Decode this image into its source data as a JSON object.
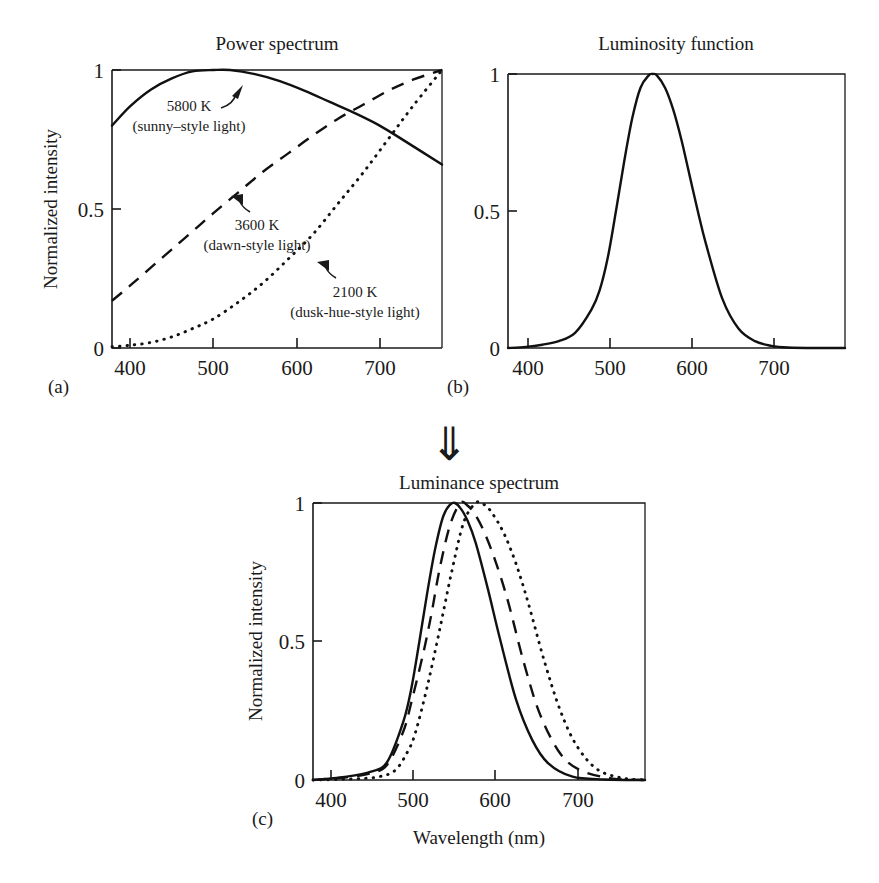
{
  "figure": {
    "panels": [
      {
        "id": "a",
        "label": "(a)",
        "title": "Power spectrum",
        "ylabel": "Normalized intensity",
        "xlabel": "",
        "annotations": [
          {
            "line1": "5800 K",
            "line2": "(sunny–style light)"
          },
          {
            "line1": "3600 K",
            "line2": "(dawn-style light)"
          },
          {
            "line1": "2100 K",
            "line2": "(dusk-hue-style light)"
          }
        ]
      },
      {
        "id": "b",
        "label": "(b)",
        "title": "Luminosity function",
        "ylabel": "",
        "xlabel": ""
      },
      {
        "id": "c",
        "label": "(c)",
        "title": "Luminance spectrum",
        "ylabel": "Normalized intensity",
        "xlabel": "Wavelength (nm)"
      }
    ],
    "flow_arrow": "⇓",
    "xticks": [
      "400",
      "500",
      "600",
      "700"
    ],
    "yticks": [
      "0",
      "0.5",
      "1"
    ]
  },
  "chart_data": [
    {
      "panel": "a",
      "type": "line",
      "title": "Power spectrum",
      "xlabel": "",
      "ylabel": "Normalized intensity",
      "xlim": [
        378,
        775
      ],
      "ylim": [
        0,
        1
      ],
      "xticks": [
        400,
        500,
        600,
        700
      ],
      "yticks": [
        0,
        0.5,
        1
      ],
      "grid": false,
      "legend": "inline annotations",
      "series": [
        {
          "name": "5800 K (sunny–style light)",
          "style": "solid",
          "annotation": "5800 K\n(sunny–style light)",
          "x": [
            378,
            400,
            425,
            450,
            475,
            500,
            520,
            550,
            580,
            610,
            640,
            670,
            700,
            730,
            775
          ],
          "values": [
            0.8,
            0.87,
            0.93,
            0.97,
            0.995,
            1.0,
            1.0,
            0.985,
            0.96,
            0.925,
            0.885,
            0.845,
            0.8,
            0.745,
            0.66
          ]
        },
        {
          "name": "3600 K (dawn-style light)",
          "style": "dashed",
          "annotation": "3600 K\n(dawn-style light)",
          "x": [
            378,
            400,
            425,
            450,
            475,
            500,
            530,
            560,
            590,
            620,
            650,
            680,
            710,
            740,
            775
          ],
          "values": [
            0.17,
            0.225,
            0.29,
            0.355,
            0.42,
            0.485,
            0.56,
            0.635,
            0.7,
            0.765,
            0.825,
            0.875,
            0.925,
            0.965,
            1.0
          ]
        },
        {
          "name": "2100 K (dusk-hue-style light)",
          "style": "dotted",
          "annotation": "2100 K\n(dusk-hue-style light)",
          "x": [
            378,
            400,
            425,
            450,
            475,
            500,
            530,
            560,
            590,
            620,
            650,
            680,
            710,
            740,
            775
          ],
          "values": [
            0.005,
            0.01,
            0.02,
            0.04,
            0.07,
            0.105,
            0.165,
            0.235,
            0.32,
            0.41,
            0.52,
            0.63,
            0.75,
            0.87,
            1.0
          ]
        }
      ]
    },
    {
      "panel": "b",
      "type": "line",
      "title": "Luminosity function",
      "xlabel": "",
      "ylabel": "",
      "xlim": [
        378,
        790
      ],
      "ylim": [
        0,
        1
      ],
      "xticks": [
        400,
        500,
        600,
        700
      ],
      "yticks": [
        0,
        0.5,
        1
      ],
      "grid": false,
      "series": [
        {
          "name": "Luminosity function V(λ)",
          "style": "solid",
          "peak_nm": 555,
          "x": [
            378,
            400,
            420,
            440,
            460,
            480,
            490,
            500,
            510,
            520,
            530,
            540,
            550,
            555,
            560,
            570,
            580,
            590,
            600,
            610,
            620,
            640,
            660,
            680,
            700,
            720,
            760,
            790
          ],
          "values": [
            0.0,
            0.004,
            0.012,
            0.025,
            0.055,
            0.14,
            0.21,
            0.33,
            0.5,
            0.68,
            0.84,
            0.95,
            0.995,
            1.0,
            0.995,
            0.95,
            0.87,
            0.76,
            0.63,
            0.5,
            0.38,
            0.18,
            0.07,
            0.025,
            0.008,
            0.002,
            0.0,
            0.0
          ]
        }
      ]
    },
    {
      "panel": "c",
      "type": "line",
      "title": "Luminance spectrum",
      "xlabel": "Wavelength (nm)",
      "ylabel": "Normalized intensity",
      "xlim": [
        378,
        790
      ],
      "ylim": [
        0,
        1
      ],
      "xticks": [
        400,
        500,
        600,
        700
      ],
      "yticks": [
        0,
        0.5,
        1
      ],
      "grid": false,
      "series": [
        {
          "name": "5800 K luminance",
          "style": "solid",
          "peak_nm": 551,
          "x": [
            378,
            420,
            450,
            470,
            490,
            500,
            510,
            520,
            530,
            540,
            551,
            560,
            570,
            580,
            595,
            610,
            630,
            650,
            670,
            700,
            740,
            790
          ],
          "values": [
            0.0,
            0.012,
            0.03,
            0.065,
            0.21,
            0.33,
            0.5,
            0.68,
            0.84,
            0.955,
            1.0,
            0.985,
            0.935,
            0.855,
            0.69,
            0.51,
            0.29,
            0.145,
            0.06,
            0.012,
            0.002,
            0.0
          ]
        },
        {
          "name": "3600 K luminance",
          "style": "dashed",
          "peak_nm": 561,
          "x": [
            378,
            420,
            450,
            470,
            490,
            500,
            515,
            525,
            535,
            548,
            561,
            570,
            580,
            592,
            605,
            620,
            640,
            660,
            685,
            710,
            750,
            790
          ],
          "values": [
            0.0,
            0.01,
            0.025,
            0.055,
            0.175,
            0.28,
            0.46,
            0.6,
            0.76,
            0.92,
            1.0,
            0.99,
            0.955,
            0.885,
            0.785,
            0.645,
            0.42,
            0.235,
            0.095,
            0.035,
            0.005,
            0.0
          ]
        },
        {
          "name": "2100 K luminance",
          "style": "dotted",
          "peak_nm": 580,
          "x": [
            378,
            430,
            460,
            480,
            495,
            505,
            520,
            535,
            550,
            565,
            580,
            590,
            600,
            615,
            630,
            645,
            665,
            685,
            705,
            730,
            760,
            790
          ],
          "values": [
            0.0,
            0.004,
            0.012,
            0.035,
            0.1,
            0.17,
            0.34,
            0.54,
            0.75,
            0.93,
            1.0,
            0.995,
            0.965,
            0.89,
            0.78,
            0.64,
            0.43,
            0.25,
            0.125,
            0.04,
            0.008,
            0.0
          ]
        }
      ]
    }
  ]
}
